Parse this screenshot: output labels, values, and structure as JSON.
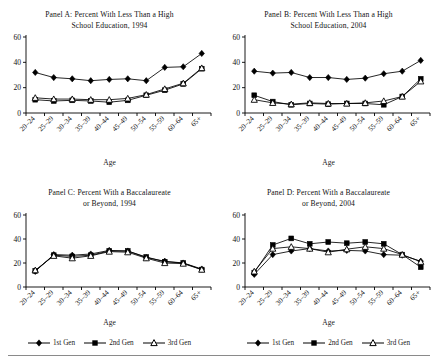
{
  "figure": {
    "axis_label_x": "Age",
    "categories": [
      "20–24",
      "25–29",
      "30–34",
      "35–39",
      "40–44",
      "45–49",
      "50–54",
      "55–59",
      "60–64",
      "65+"
    ],
    "y_ticks": [
      "0",
      "20",
      "40",
      "60"
    ],
    "series_names": [
      "1st Gen",
      "2nd Gen",
      "3rd Gen"
    ],
    "legend": {
      "left": [
        {
          "label": "1st Gen",
          "marker": "diamond-filled-marker"
        },
        {
          "label": "2nd Gen",
          "marker": "square-filled-marker"
        },
        {
          "label": "3rd Gen",
          "marker": "triangle-open-marker"
        }
      ],
      "right": [
        {
          "label": "1st Gen",
          "marker": "diamond-filled-marker"
        },
        {
          "label": "2nd Gen",
          "marker": "square-filled-marker"
        },
        {
          "label": "3rd Gen",
          "marker": "triangle-open-marker"
        }
      ]
    }
  },
  "panels": {
    "A": {
      "title_line1": "Panel A: Percent With Less Than a High",
      "title_line2": "School Education, 1994"
    },
    "B": {
      "title_line1": "Panel B: Percent With Less Than a High",
      "title_line2": "School Education, 2004"
    },
    "C": {
      "title_line1": "Panel C: Percent With a Baccalaureate",
      "title_line2": "or Beyond, 1994"
    },
    "D": {
      "title_line1": "Panel D: Percent With a Baccalaureate",
      "title_line2": "or Beyond, 2004"
    }
  },
  "chart_data": [
    {
      "type": "line",
      "panel": "A",
      "title": "Panel A: Percent With Less Than a High School Education, 1994",
      "xlabel": "Age",
      "ylabel": "",
      "ylim": [
        0,
        60
      ],
      "yticks": [
        0,
        20,
        40,
        60
      ],
      "grid": false,
      "legend_position": "below-figure",
      "categories": [
        "20–24",
        "25–29",
        "30–34",
        "35–39",
        "40–44",
        "45–49",
        "50–54",
        "55–59",
        "60–64",
        "65+"
      ],
      "series": [
        {
          "name": "1st Gen",
          "marker": "diamond-filled",
          "values": [
            32,
            28,
            27,
            25.5,
            26.5,
            27,
            25.5,
            36,
            36.5,
            47
          ]
        },
        {
          "name": "2nd Gen",
          "marker": "square-filled",
          "values": [
            10.5,
            9.5,
            10,
            9.5,
            8.5,
            10,
            14,
            18,
            23,
            35
          ]
        },
        {
          "name": "3rd Gen",
          "marker": "triangle-open",
          "values": [
            12,
            11,
            11,
            10.5,
            10.5,
            11.5,
            14.5,
            19,
            23.5,
            35.5
          ]
        }
      ]
    },
    {
      "type": "line",
      "panel": "B",
      "title": "Panel B: Percent With Less Than a High School Education, 2004",
      "xlabel": "Age",
      "ylabel": "",
      "ylim": [
        0,
        60
      ],
      "yticks": [
        0,
        20,
        40,
        60
      ],
      "grid": false,
      "legend_position": "below-figure",
      "categories": [
        "20–24",
        "25–29",
        "30–34",
        "35–39",
        "40–44",
        "45–49",
        "50–54",
        "55–59",
        "60–64",
        "65+"
      ],
      "series": [
        {
          "name": "1st Gen",
          "marker": "diamond-filled",
          "values": [
            33,
            31.5,
            32,
            28,
            28,
            26.5,
            27.5,
            31,
            33,
            41.5
          ]
        },
        {
          "name": "2nd Gen",
          "marker": "square-filled",
          "values": [
            14,
            9,
            6.5,
            7.5,
            7,
            7.5,
            7.5,
            6.5,
            13,
            27
          ]
        },
        {
          "name": "3rd Gen",
          "marker": "triangle-open",
          "values": [
            10.5,
            8,
            7,
            8,
            7.5,
            7.5,
            8,
            9.5,
            13,
            25
          ]
        }
      ]
    },
    {
      "type": "line",
      "panel": "C",
      "title": "Panel C: Percent With a Baccalaureate or Beyond, 1994",
      "xlabel": "Age",
      "ylabel": "",
      "ylim": [
        0,
        60
      ],
      "yticks": [
        0,
        20,
        40,
        60
      ],
      "grid": false,
      "legend_position": "below-figure",
      "categories": [
        "20–24",
        "25–29",
        "30–34",
        "35–39",
        "40–44",
        "45–49",
        "50–54",
        "55–59",
        "60–64",
        "65+"
      ],
      "series": [
        {
          "name": "1st Gen",
          "marker": "diamond-filled",
          "values": [
            13,
            27,
            26.5,
            27.5,
            30.5,
            30,
            24.5,
            21.5,
            20,
            15
          ]
        },
        {
          "name": "2nd Gen",
          "marker": "square-filled",
          "values": [
            13.5,
            26.5,
            25.5,
            26.5,
            30,
            30,
            25,
            21,
            20,
            14.5
          ]
        },
        {
          "name": "3rd Gen",
          "marker": "triangle-open",
          "values": [
            14,
            26,
            24,
            26,
            29.5,
            29,
            24,
            20,
            19.5,
            14.5
          ]
        }
      ]
    },
    {
      "type": "line",
      "panel": "D",
      "title": "Panel D: Percent With a Baccalaureate or Beyond, 2004",
      "xlabel": "Age",
      "ylabel": "",
      "ylim": [
        0,
        60
      ],
      "yticks": [
        0,
        20,
        40,
        60
      ],
      "grid": false,
      "legend_position": "below-figure",
      "categories": [
        "20–24",
        "25–29",
        "30–34",
        "35–39",
        "40–44",
        "45–49",
        "50–54",
        "55–59",
        "60–64",
        "65+"
      ],
      "series": [
        {
          "name": "1st Gen",
          "marker": "diamond-filled",
          "values": [
            10.5,
            27,
            30,
            32,
            30,
            30.5,
            30,
            27,
            26.5,
            21.5
          ]
        },
        {
          "name": "2nd Gen",
          "marker": "square-filled",
          "values": [
            12,
            35,
            40.5,
            36,
            37.5,
            36.5,
            37.5,
            36,
            27,
            16.5
          ]
        },
        {
          "name": "3rd Gen",
          "marker": "triangle-open",
          "values": [
            13,
            32,
            33.5,
            32,
            29,
            31.5,
            33.5,
            32,
            27,
            21
          ]
        }
      ]
    }
  ]
}
